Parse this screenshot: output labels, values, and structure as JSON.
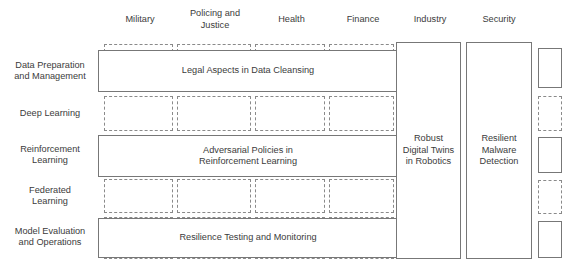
{
  "figure": {
    "type": "matrix-diagram",
    "line_color": "#777777",
    "dashed_color": "#8a8a8a",
    "text_color": "#3b3b3b",
    "background": "#ffffff"
  },
  "columns": [
    {
      "id": "military",
      "label": "Military"
    },
    {
      "id": "policing-and-justice",
      "label": "Policing and\nJustice"
    },
    {
      "id": "health",
      "label": "Health"
    },
    {
      "id": "finance",
      "label": "Finance"
    },
    {
      "id": "industry",
      "label": "Industry"
    },
    {
      "id": "security",
      "label": "Security"
    }
  ],
  "rows": [
    {
      "id": "data-preparation-and-management",
      "label": "Data Preparation\nand Management"
    },
    {
      "id": "deep-learning",
      "label": "Deep Learning"
    },
    {
      "id": "reinforcement-learning",
      "label": "Reinforcement\nLearning"
    },
    {
      "id": "federated-learning",
      "label": "Federated\nLearning"
    },
    {
      "id": "model-evaluation-and-operations",
      "label": "Model Evaluation\nand Operations"
    }
  ],
  "themes": [
    {
      "id": "legal-aspects-in-data-cleansing",
      "label": "Legal Aspects in Data Cleansing",
      "orientation": "horizontal",
      "row": "data-preparation-and-management",
      "spans_columns": [
        "military",
        "policing-and-justice",
        "health",
        "finance"
      ]
    },
    {
      "id": "adversarial-policies-in-reinforcement-learning",
      "label": "Adversarial Policies in\nReinforcement Learning",
      "orientation": "horizontal",
      "row": "reinforcement-learning",
      "spans_columns": [
        "military",
        "policing-and-justice",
        "health",
        "finance"
      ]
    },
    {
      "id": "resilience-testing-and-monitoring",
      "label": "Resilience Testing and Monitoring",
      "orientation": "horizontal",
      "row": "model-evaluation-and-operations",
      "spans_columns": [
        "military",
        "policing-and-justice",
        "health",
        "finance"
      ]
    },
    {
      "id": "robust-digital-twins-in-robotics",
      "label": "Robust\nDigital Twins\nin Robotics",
      "orientation": "vertical",
      "column": "industry",
      "spans_rows": [
        "data-preparation-and-management",
        "deep-learning",
        "reinforcement-learning",
        "federated-learning",
        "model-evaluation-and-operations"
      ]
    },
    {
      "id": "resilient-malware-detection",
      "label": "Resilient\nMalware\nDetection",
      "orientation": "vertical",
      "column": "security",
      "spans_rows": [
        "data-preparation-and-management",
        "deep-learning",
        "reinforcement-learning",
        "federated-learning",
        "model-evaluation-and-operations"
      ]
    }
  ]
}
